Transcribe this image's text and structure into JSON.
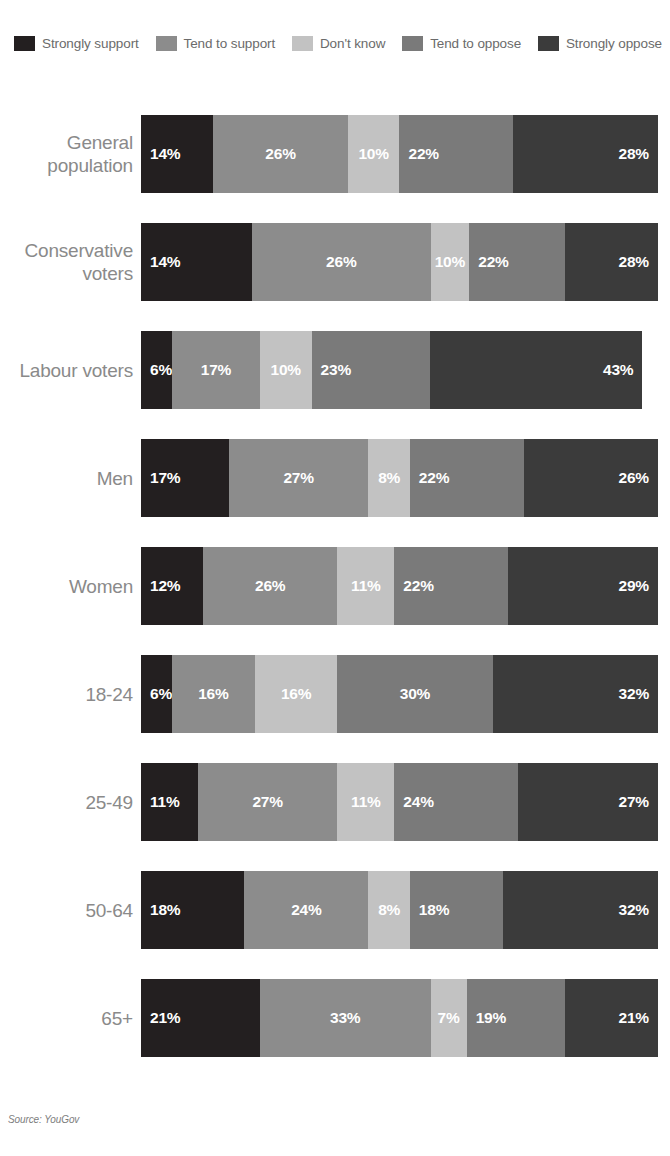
{
  "top_clipped_text": "",
  "source": {
    "text": "Source: YouGov"
  },
  "legend": {
    "items": [
      {
        "label": "Strongly support",
        "color": "#231f20"
      },
      {
        "label": "Tend to support",
        "color": "#8c8c8c"
      },
      {
        "label": "Don't know",
        "color": "#c2c2c2"
      },
      {
        "label": "Tend to oppose",
        "color": "#7a7a7a"
      },
      {
        "label": "Strongly oppose",
        "color": "#3b3b3b"
      }
    ]
  },
  "chart_data": {
    "type": "bar",
    "orientation": "horizontal",
    "stacked": true,
    "normalized_percent": true,
    "title": "",
    "xlabel": "",
    "ylabel": "",
    "xlim": [
      0,
      100
    ],
    "grid": false,
    "legend_position": "top",
    "categories": [
      "General population",
      "Conservative voters",
      "Labour voters",
      "Men",
      "Women",
      "18-24",
      "25-49",
      "50-64",
      "65+"
    ],
    "series": [
      {
        "name": "Strongly support",
        "color": "#231f20",
        "values": [
          14,
          14,
          6,
          17,
          12,
          6,
          11,
          18,
          21
        ]
      },
      {
        "name": "Tend to support",
        "color": "#8c8c8c",
        "values": [
          26,
          26,
          17,
          27,
          26,
          16,
          27,
          24,
          33
        ]
      },
      {
        "name": "Don't know",
        "color": "#c2c2c2",
        "values": [
          10,
          10,
          10,
          8,
          11,
          16,
          11,
          8,
          7
        ]
      },
      {
        "name": "Tend to oppose",
        "color": "#7a7a7a",
        "values": [
          22,
          22,
          23,
          22,
          22,
          30,
          24,
          18,
          19
        ]
      },
      {
        "name": "Strongly oppose",
        "color": "#3b3b3b",
        "values": [
          28,
          28,
          43,
          26,
          29,
          32,
          27,
          32,
          21
        ]
      }
    ],
    "rows": [
      {
        "label": "General population",
        "label_lines": [
          "General",
          "population"
        ],
        "segments": [
          {
            "series": "Strongly support",
            "value": 14,
            "label": "14%",
            "width_pct": 14.0,
            "align": "left"
          },
          {
            "series": "Tend to support",
            "value": 26,
            "label": "26%",
            "width_pct": 26.0,
            "align": "center"
          },
          {
            "series": "Don't know",
            "value": 10,
            "label": "10%",
            "width_pct": 10.0,
            "align": "center"
          },
          {
            "series": "Tend to oppose",
            "value": 22,
            "label": "22%",
            "width_pct": 22.0,
            "align": "left"
          },
          {
            "series": "Strongly oppose",
            "value": 28,
            "label": "28%",
            "width_pct": 28.0,
            "align": "right"
          }
        ]
      },
      {
        "label": "Conservative voters",
        "label_lines": [
          "Conservative",
          "voters"
        ],
        "segments": [
          {
            "series": "Strongly support",
            "value": 14,
            "label": "14%",
            "width_pct": 21.5,
            "align": "left"
          },
          {
            "series": "Tend to support",
            "value": 26,
            "label": "26%",
            "width_pct": 34.5,
            "align": "center"
          },
          {
            "series": "Don't know",
            "value": 10,
            "label": "10%",
            "width_pct": 7.5,
            "align": "center"
          },
          {
            "series": "Tend to oppose",
            "value": 22,
            "label": "22%",
            "width_pct": 18.5,
            "align": "left"
          },
          {
            "series": "Strongly oppose",
            "value": 28,
            "label": "28%",
            "width_pct": 18.0,
            "align": "right"
          }
        ]
      },
      {
        "label": "Labour voters",
        "label_lines": [
          "Labour voters"
        ],
        "segments": [
          {
            "series": "Strongly support",
            "value": 6,
            "label": "6%",
            "width_pct": 6.0,
            "align": "left"
          },
          {
            "series": "Tend to support",
            "value": 17,
            "label": "17%",
            "width_pct": 17.0,
            "align": "center"
          },
          {
            "series": "Don't know",
            "value": 10,
            "label": "10%",
            "width_pct": 10.0,
            "align": "center"
          },
          {
            "series": "Tend to oppose",
            "value": 23,
            "label": "23%",
            "width_pct": 23.0,
            "align": "left"
          },
          {
            "series": "Strongly oppose",
            "value": 43,
            "label": "43%",
            "width_pct": 41.0,
            "align": "right"
          }
        ]
      },
      {
        "label": "Men",
        "label_lines": [
          "Men"
        ],
        "segments": [
          {
            "series": "Strongly support",
            "value": 17,
            "label": "17%",
            "width_pct": 17.0,
            "align": "left"
          },
          {
            "series": "Tend to support",
            "value": 27,
            "label": "27%",
            "width_pct": 27.0,
            "align": "center"
          },
          {
            "series": "Don't know",
            "value": 8,
            "label": "8%",
            "width_pct": 8.0,
            "align": "center"
          },
          {
            "series": "Tend to oppose",
            "value": 22,
            "label": "22%",
            "width_pct": 22.0,
            "align": "left"
          },
          {
            "series": "Strongly oppose",
            "value": 26,
            "label": "26%",
            "width_pct": 26.0,
            "align": "right"
          }
        ]
      },
      {
        "label": "Women",
        "label_lines": [
          "Women"
        ],
        "segments": [
          {
            "series": "Strongly support",
            "value": 12,
            "label": "12%",
            "width_pct": 12.0,
            "align": "left"
          },
          {
            "series": "Tend to support",
            "value": 26,
            "label": "26%",
            "width_pct": 26.0,
            "align": "center"
          },
          {
            "series": "Don't know",
            "value": 11,
            "label": "11%",
            "width_pct": 11.0,
            "align": "center"
          },
          {
            "series": "Tend to oppose",
            "value": 22,
            "label": "22%",
            "width_pct": 22.0,
            "align": "left"
          },
          {
            "series": "Strongly oppose",
            "value": 29,
            "label": "29%",
            "width_pct": 29.0,
            "align": "right"
          }
        ]
      },
      {
        "label": "18-24",
        "label_lines": [
          "18-24"
        ],
        "segments": [
          {
            "series": "Strongly support",
            "value": 6,
            "label": "6%",
            "width_pct": 6.0,
            "align": "left"
          },
          {
            "series": "Tend to support",
            "value": 16,
            "label": "16%",
            "width_pct": 16.0,
            "align": "center"
          },
          {
            "series": "Don't know",
            "value": 16,
            "label": "16%",
            "width_pct": 16.0,
            "align": "center"
          },
          {
            "series": "Tend to oppose",
            "value": 30,
            "label": "30%",
            "width_pct": 30.0,
            "align": "center"
          },
          {
            "series": "Strongly oppose",
            "value": 32,
            "label": "32%",
            "width_pct": 32.0,
            "align": "right"
          }
        ]
      },
      {
        "label": "25-49",
        "label_lines": [
          "25-49"
        ],
        "segments": [
          {
            "series": "Strongly support",
            "value": 11,
            "label": "11%",
            "width_pct": 11.0,
            "align": "left"
          },
          {
            "series": "Tend to support",
            "value": 27,
            "label": "27%",
            "width_pct": 27.0,
            "align": "center"
          },
          {
            "series": "Don't know",
            "value": 11,
            "label": "11%",
            "width_pct": 11.0,
            "align": "center"
          },
          {
            "series": "Tend to oppose",
            "value": 24,
            "label": "24%",
            "width_pct": 24.0,
            "align": "left"
          },
          {
            "series": "Strongly oppose",
            "value": 27,
            "label": "27%",
            "width_pct": 27.0,
            "align": "right"
          }
        ]
      },
      {
        "label": "50-64",
        "label_lines": [
          "50-64"
        ],
        "segments": [
          {
            "series": "Strongly support",
            "value": 18,
            "label": "18%",
            "width_pct": 20.0,
            "align": "left"
          },
          {
            "series": "Tend to support",
            "value": 24,
            "label": "24%",
            "width_pct": 24.0,
            "align": "center"
          },
          {
            "series": "Don't know",
            "value": 8,
            "label": "8%",
            "width_pct": 8.0,
            "align": "center"
          },
          {
            "series": "Tend to oppose",
            "value": 18,
            "label": "18%",
            "width_pct": 18.0,
            "align": "left"
          },
          {
            "series": "Strongly oppose",
            "value": 32,
            "label": "32%",
            "width_pct": 30.0,
            "align": "right"
          }
        ]
      },
      {
        "label": "65+",
        "label_lines": [
          "65+"
        ],
        "segments": [
          {
            "series": "Strongly support",
            "value": 21,
            "label": "21%",
            "width_pct": 23.0,
            "align": "left"
          },
          {
            "series": "Tend to support",
            "value": 33,
            "label": "33%",
            "width_pct": 33.0,
            "align": "center"
          },
          {
            "series": "Don't know",
            "value": 7,
            "label": "7%",
            "width_pct": 7.0,
            "align": "center"
          },
          {
            "series": "Tend to oppose",
            "value": 19,
            "label": "19%",
            "width_pct": 19.0,
            "align": "left"
          },
          {
            "series": "Strongly oppose",
            "value": 21,
            "label": "21%",
            "width_pct": 18.0,
            "align": "right"
          }
        ]
      }
    ]
  }
}
